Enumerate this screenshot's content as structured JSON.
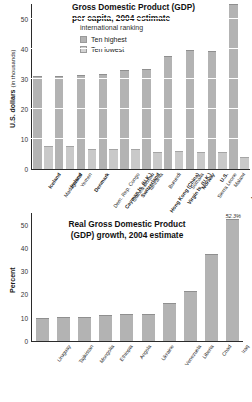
{
  "chart_data": [
    {
      "type": "bar",
      "id": "gdp-per-capita",
      "title_line1": "Gross Domestic Product (GDP)",
      "title_line2": "per capita, 2004 estimate",
      "subtitle": "international ranking",
      "ylabel": "U.S. dollars",
      "ylabel_sub": "(in thousands)",
      "xlabel": "",
      "ylim": [
        0,
        55
      ],
      "yticks": [
        0,
        10,
        20,
        30,
        40,
        50
      ],
      "ytick_labels": [
        "0",
        "10",
        "20",
        "30",
        "40",
        "50"
      ],
      "grid": true,
      "legend_position": "top-center",
      "legend": [
        {
          "label": "Ten highest",
          "color": "#b3b3b3",
          "key": "high"
        },
        {
          "label": "Ten lowest",
          "color": "#d2d2d2",
          "key": "low"
        }
      ],
      "categories": [
        "Iceland",
        "Madagascar",
        "Ireland",
        "Yemen",
        "Denmark",
        "Dem. Rep. Congo",
        "Cayman Is. (U.K.)",
        "Guinea-Bissau",
        "Switzerland",
        "Tanzania",
        "Hong Kong (China)",
        "Burundi",
        "Virgin Is. (U.K.)",
        "Somalia",
        "Norway",
        "Sierra Leone",
        "U.S.",
        "Malawi",
        "Luxembourg",
        "Timor-Leste (East Timor)"
      ],
      "category_labels_line2": [
        "",
        "",
        "",
        "",
        "",
        "",
        "",
        "",
        "",
        "",
        "",
        "",
        "",
        "",
        "",
        "",
        "",
        "",
        "",
        "(East Timor)"
      ],
      "category_group": [
        "high",
        "low",
        "high",
        "low",
        "high",
        "low",
        "high",
        "low",
        "high",
        "low",
        "high",
        "low",
        "high",
        "low",
        "high",
        "low",
        "high",
        "low",
        "high",
        "low"
      ],
      "values": [
        31.0,
        7.7,
        31.1,
        7.6,
        31.3,
        6.8,
        31.6,
        6.8,
        32.9,
        6.6,
        33.3,
        5.8,
        37.8,
        5.9,
        39.6,
        5.8,
        39.5,
        5.8,
        55.0,
        4.0
      ]
    },
    {
      "type": "bar",
      "id": "gdp-growth",
      "title_line1": "Real Gross Domestic Product",
      "title_line2": "(GDP) growth, 2004 estimate",
      "subtitle": "",
      "ylabel": "Percent",
      "ylabel_sub": "",
      "xlabel": "",
      "ylim": [
        0,
        55
      ],
      "yticks": [
        0,
        10,
        20,
        30,
        40,
        50
      ],
      "ytick_labels": [
        "0",
        "10",
        "20",
        "30",
        "40",
        "50"
      ],
      "grid": false,
      "legend_position": "none",
      "legend": [],
      "categories": [
        "Uruguay",
        "Tajikistan",
        "Mongolia",
        "Ethiopia",
        "Angola",
        "Ukraine",
        "Venezuela",
        "Liberia",
        "Chad",
        "Iraq"
      ],
      "values": [
        9.8,
        10.2,
        10.2,
        11.3,
        11.4,
        11.6,
        16.5,
        21.5,
        37.2,
        52.3
      ],
      "annotations": [
        {
          "index": 9,
          "text": "52.3%"
        }
      ]
    }
  ]
}
